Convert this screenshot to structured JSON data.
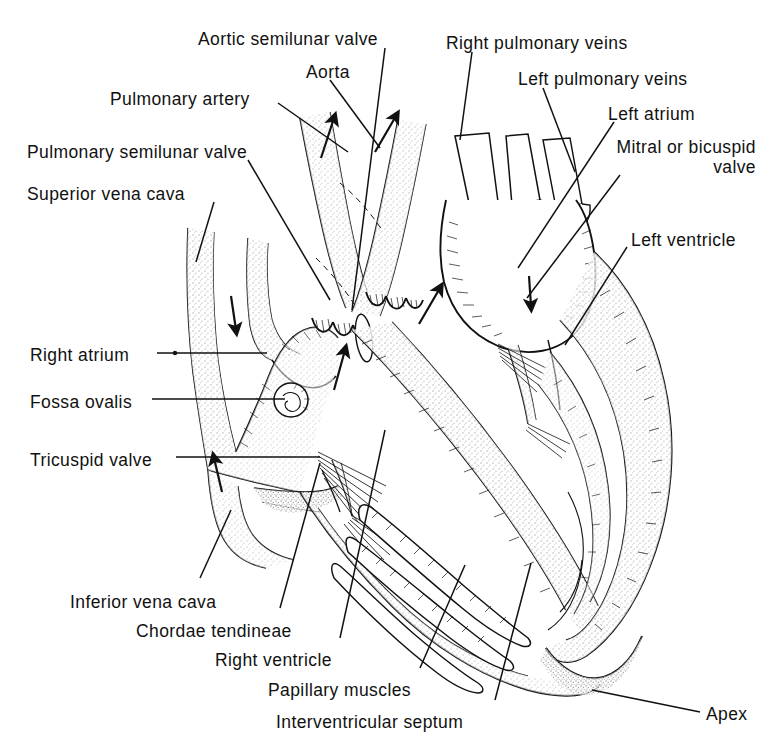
{
  "figure": {
    "kind": "anatomical-line-drawing",
    "background_color": "#ffffff",
    "ink_color": "#111111",
    "stipple_color": "#8a8a8a"
  },
  "labels": [
    {
      "id": "aortic-semilunar-valve",
      "text": "Aortic semilunar  valve",
      "x": 198,
      "y": 29,
      "align": "left"
    },
    {
      "id": "aorta",
      "text": "Aorta",
      "x": 306,
      "y": 62,
      "align": "left"
    },
    {
      "id": "pulmonary-artery",
      "text": "Pulmonary artery",
      "x": 110,
      "y": 89,
      "align": "left"
    },
    {
      "id": "pulmonary-semilunar-valve",
      "text": "Pulmonary semilunar  valve",
      "x": 27,
      "y": 142,
      "align": "left"
    },
    {
      "id": "superior-vena-cava",
      "text": "Superior vena cava",
      "x": 27,
      "y": 184,
      "align": "left"
    },
    {
      "id": "right-pulmonary-veins",
      "text": "Right pulmonary veins",
      "x": 446,
      "y": 33,
      "align": "left"
    },
    {
      "id": "left-pulmonary-veins",
      "text": "Left pulmonary veins",
      "x": 518,
      "y": 69,
      "align": "left"
    },
    {
      "id": "left-atrium",
      "text": "Left atrium",
      "x": 608,
      "y": 104,
      "align": "left"
    },
    {
      "id": "mitral-or-bicuspid-valve",
      "text": "Mitral or\nbicuspid valve",
      "x": 611,
      "y": 137,
      "align": "left"
    },
    {
      "id": "left-ventricle",
      "text": "Left ventricle",
      "x": 631,
      "y": 230,
      "align": "left"
    },
    {
      "id": "right-atrium",
      "text": "Right atrium",
      "x": 30,
      "y": 345,
      "align": "left"
    },
    {
      "id": "fossa-ovalis",
      "text": "Fossa ovalis",
      "x": 30,
      "y": 392,
      "align": "left"
    },
    {
      "id": "tricuspid-valve",
      "text": "Tricuspid valve",
      "x": 30,
      "y": 450,
      "align": "left"
    },
    {
      "id": "inferior-vena-cava",
      "text": "Inferior vena cava",
      "x": 70,
      "y": 592,
      "align": "left"
    },
    {
      "id": "chordae-tendineae",
      "text": "Chordae tendineae",
      "x": 136,
      "y": 621,
      "align": "left"
    },
    {
      "id": "right-ventricle",
      "text": "Right ventricle",
      "x": 215,
      "y": 650,
      "align": "left"
    },
    {
      "id": "papillary-muscles",
      "text": "Papillary muscles",
      "x": 268,
      "y": 680,
      "align": "left"
    },
    {
      "id": "interventricular-septum",
      "text": "Interventricular septum",
      "x": 276,
      "y": 712,
      "align": "left"
    },
    {
      "id": "apex",
      "text": "Apex",
      "x": 706,
      "y": 704,
      "align": "left"
    }
  ],
  "leader_lines": [
    {
      "id": "leader-aortic-semilunar-valve",
      "from": [
        385,
        48
      ],
      "to": [
        352,
        310
      ]
    },
    {
      "id": "leader-aorta",
      "from": [
        330,
        80
      ],
      "to": [
        380,
        148
      ]
    },
    {
      "id": "leader-pulmonary-artery",
      "from": [
        278,
        103
      ],
      "to": [
        348,
        152
      ]
    },
    {
      "id": "leader-pulmonary-semilunar-valve",
      "from": [
        248,
        160
      ],
      "to": [
        330,
        300
      ]
    },
    {
      "id": "leader-superior-vena-cava",
      "from": [
        214,
        202
      ],
      "to": [
        196,
        262
      ]
    },
    {
      "id": "leader-right-pulmonary-veins",
      "from": [
        472,
        52
      ],
      "to": [
        460,
        140
      ]
    },
    {
      "id": "leader-left-pulmonary-veins",
      "from": [
        543,
        88
      ],
      "to": [
        575,
        172
      ]
    },
    {
      "id": "leader-left-atrium",
      "from": [
        614,
        122
      ],
      "to": [
        518,
        268
      ]
    },
    {
      "id": "leader-mitral-bicuspid-valve",
      "from": [
        620,
        175
      ],
      "to": [
        527,
        298
      ]
    },
    {
      "id": "leader-left-ventricle",
      "from": [
        627,
        247
      ],
      "to": [
        565,
        345
      ]
    },
    {
      "id": "leader-right-atrium",
      "from": [
        157,
        353
      ],
      "to": [
        267,
        353
      ]
    },
    {
      "id": "leader-fossa-ovalis",
      "from": [
        152,
        399
      ],
      "to": [
        285,
        399
      ]
    },
    {
      "id": "leader-tricuspid-valve",
      "from": [
        176,
        457
      ],
      "to": [
        320,
        457
      ]
    },
    {
      "id": "leader-inferior-vena-cava",
      "from": [
        200,
        578
      ],
      "to": [
        231,
        510
      ]
    },
    {
      "id": "leader-chordae-tendineae",
      "from": [
        280,
        608
      ],
      "to": [
        320,
        463
      ]
    },
    {
      "id": "leader-right-ventricle",
      "from": [
        340,
        638
      ],
      "to": [
        385,
        430
      ]
    },
    {
      "id": "leader-papillary-muscles",
      "from": [
        420,
        668
      ],
      "to": [
        465,
        565
      ]
    },
    {
      "id": "leader-interventricular-septum",
      "from": [
        495,
        700
      ],
      "to": [
        531,
        563
      ]
    },
    {
      "id": "leader-apex",
      "from": [
        700,
        712
      ],
      "to": [
        592,
        690
      ]
    }
  ],
  "flow_arrows": [
    {
      "id": "arrow-svc-inflow",
      "x": 235,
      "y": 312,
      "dir": "down"
    },
    {
      "id": "arrow-ivc-inflow",
      "x": 218,
      "y": 473,
      "dir": "up"
    },
    {
      "id": "arrow-pa-outflow",
      "x": 330,
      "y": 130,
      "dir": "up"
    },
    {
      "id": "arrow-aorta-outflow",
      "x": 388,
      "y": 126,
      "dir": "up"
    },
    {
      "id": "arrow-rv-inflow",
      "x": 341,
      "y": 360,
      "dir": "up"
    },
    {
      "id": "arrow-lv-inflow",
      "x": 432,
      "y": 296,
      "dir": "up"
    },
    {
      "id": "arrow-la-inflow",
      "x": 530,
      "y": 290,
      "dir": "down"
    }
  ],
  "structures": [
    {
      "id": "superior-vena-cava-vessel",
      "name": "Superior vena cava"
    },
    {
      "id": "inferior-vena-cava-vessel",
      "name": "Inferior vena cava"
    },
    {
      "id": "aorta-vessel",
      "name": "Aorta"
    },
    {
      "id": "pulmonary-artery-vessel",
      "name": "Pulmonary artery"
    },
    {
      "id": "right-pulmonary-veins-vessels",
      "name": "Right pulmonary veins"
    },
    {
      "id": "left-pulmonary-veins-vessels",
      "name": "Left pulmonary veins"
    },
    {
      "id": "right-atrium-chamber",
      "name": "Right atrium"
    },
    {
      "id": "left-atrium-chamber",
      "name": "Left atrium"
    },
    {
      "id": "right-ventricle-chamber",
      "name": "Right ventricle"
    },
    {
      "id": "left-ventricle-chamber",
      "name": "Left ventricle"
    },
    {
      "id": "fossa-ovalis-depression",
      "name": "Fossa ovalis"
    },
    {
      "id": "tricuspid-valve-cusps",
      "name": "Tricuspid valve"
    },
    {
      "id": "mitral-valve-cusps",
      "name": "Mitral or bicuspid valve"
    },
    {
      "id": "aortic-semilunar-valve-cusps",
      "name": "Aortic semilunar valve"
    },
    {
      "id": "pulmonary-semilunar-valve-cusps",
      "name": "Pulmonary semilunar valve"
    },
    {
      "id": "chordae-tendineae-strands",
      "name": "Chordae tendineae"
    },
    {
      "id": "papillary-muscles-bundles",
      "name": "Papillary muscles"
    },
    {
      "id": "interventricular-septum-wall",
      "name": "Interventricular septum"
    },
    {
      "id": "apex-point",
      "name": "Apex"
    }
  ]
}
